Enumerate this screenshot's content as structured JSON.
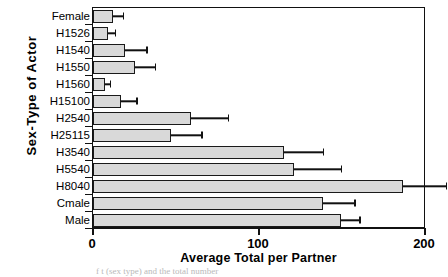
{
  "chart_data": {
    "type": "bar",
    "orientation": "horizontal",
    "title": "",
    "xlabel": "Average Total per Partner",
    "ylabel": "Sex-Type of Actor",
    "xlim": [
      0,
      200
    ],
    "xticks": [
      0,
      100,
      200
    ],
    "xticklabels": [
      "0",
      "100",
      "200"
    ],
    "grid": false,
    "legend": false,
    "categories": [
      "Female",
      "H1526",
      "H1540",
      "H1550",
      "H1560",
      "H15100",
      "H2540",
      "H25115",
      "H3540",
      "H5540",
      "H8040",
      "Cmale",
      "Male"
    ],
    "values": [
      12,
      9,
      19,
      25,
      7,
      17,
      59,
      47,
      115,
      121,
      186,
      138,
      149
    ],
    "errors": [
      6,
      4,
      13,
      12,
      3,
      9,
      22,
      18,
      23,
      28,
      26,
      19,
      11
    ],
    "series": [
      {
        "name": "Average Total per Partner",
        "values": [
          12,
          9,
          19,
          25,
          7,
          17,
          59,
          47,
          115,
          121,
          186,
          138,
          149
        ]
      }
    ],
    "bar_color": "#d9d9d9",
    "bar_edge_color": "#1a1a1a"
  },
  "axes": {
    "y_title": "Sex-Type  of  Actor",
    "x_title": "Average Total per Partner",
    "x_tick_0": "0",
    "x_tick_1": "100",
    "x_tick_2": "200"
  },
  "caption": "f        t (sex type) and the total number"
}
